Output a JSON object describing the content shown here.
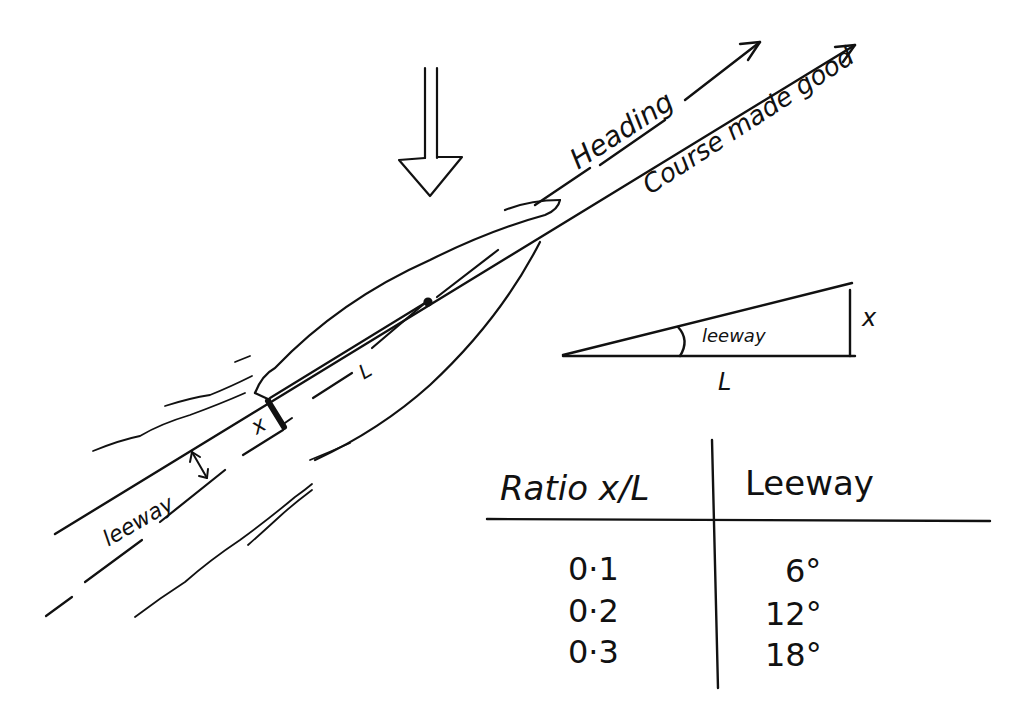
{
  "labels": {
    "heading": "Heading",
    "course_made_good": "Course made good",
    "leeway_main": "leeway",
    "offset_x": "x",
    "length_l": "L",
    "triangle_leeway": "leeway",
    "triangle_x": "x",
    "triangle_l": "L"
  },
  "table": {
    "headers": [
      "Ratio x/L",
      "Leeway"
    ],
    "rows": [
      {
        "ratio": "0·1",
        "leeway": "6°"
      },
      {
        "ratio": "0·2",
        "leeway": "12°"
      },
      {
        "ratio": "0·3",
        "leeway": "18°"
      }
    ]
  },
  "colors": {
    "ink": "#111111",
    "paper": "#ffffff"
  }
}
